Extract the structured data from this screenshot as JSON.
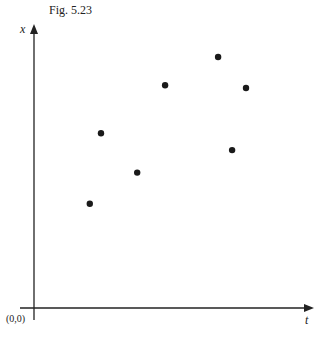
{
  "figure": {
    "caption": "Fig. 5.23",
    "x_axis_label": "t",
    "y_axis_label": "x",
    "origin_label": "(0,0)"
  },
  "chart_data": {
    "type": "scatter",
    "title": "Fig. 5.23",
    "xlabel": "t",
    "ylabel": "x",
    "origin": "(0,0)",
    "grid": false,
    "legend": null,
    "note": "No tick labels; values in relative units (0-100) estimated from pixel positions along each axis",
    "points": [
      {
        "t": 20,
        "x": 37
      },
      {
        "t": 24,
        "x": 62
      },
      {
        "t": 37,
        "x": 48
      },
      {
        "t": 47,
        "x": 79
      },
      {
        "t": 66,
        "x": 89
      },
      {
        "t": 71,
        "x": 56
      },
      {
        "t": 76,
        "x": 78
      }
    ],
    "xlim": [
      0,
      100
    ],
    "ylim": [
      0,
      100
    ],
    "marker_color": "#1a1a1a",
    "axis_color": "#222222"
  }
}
